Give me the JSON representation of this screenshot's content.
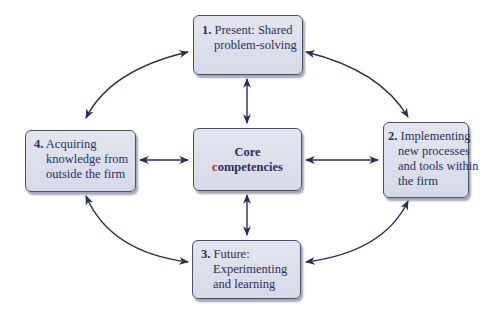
{
  "diagram": {
    "colors": {
      "box_fill": "#dde1ec",
      "box_border": "#4a4f6a",
      "text": "#2b2f5a",
      "arrow": "#2a2d55",
      "accent": "#b0204a"
    },
    "center": {
      "line1": "Core",
      "line2_accent": "c",
      "line2_rest": "ompetencies"
    },
    "nodes": [
      {
        "number": "1.",
        "line1": "Present: Shared",
        "line2": "problem-solving"
      },
      {
        "number": "2.",
        "line1": "Implementing",
        "line2": "new processes",
        "line3": "and tools within",
        "line4": "the firm"
      },
      {
        "number": "3.",
        "line1": "Future:",
        "line2": "Experimenting",
        "line3": "and learning"
      },
      {
        "number": "4.",
        "line1": "Acquiring",
        "line2": "knowledge from",
        "line3": "outside the firm"
      }
    ],
    "connections": [
      {
        "from": "center",
        "to": "1",
        "type": "bidirectional"
      },
      {
        "from": "center",
        "to": "2",
        "type": "bidirectional"
      },
      {
        "from": "center",
        "to": "3",
        "type": "bidirectional"
      },
      {
        "from": "center",
        "to": "4",
        "type": "bidirectional"
      },
      {
        "from": "1",
        "to": "2",
        "type": "bidirectional-curved"
      },
      {
        "from": "2",
        "to": "3",
        "type": "bidirectional-curved"
      },
      {
        "from": "3",
        "to": "4",
        "type": "bidirectional-curved"
      },
      {
        "from": "4",
        "to": "1",
        "type": "bidirectional-curved"
      }
    ]
  }
}
